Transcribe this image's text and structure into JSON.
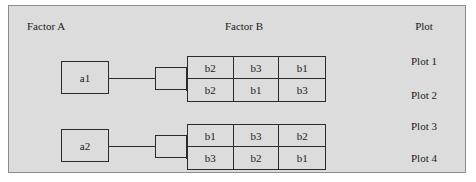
{
  "figure": {
    "headers": {
      "factor_a": "Factor A",
      "factor_b": "Factor B",
      "plot": "Plot"
    },
    "whole_plots": [
      {
        "label": "a1"
      },
      {
        "label": "a2"
      }
    ],
    "sub_plot_grids": [
      {
        "rows": [
          {
            "cells": [
              "b2",
              "b3",
              "b1"
            ]
          },
          {
            "cells": [
              "b2",
              "b1",
              "b3"
            ]
          }
        ]
      },
      {
        "rows": [
          {
            "cells": [
              "b1",
              "b3",
              "b2"
            ]
          },
          {
            "cells": [
              "b3",
              "b2",
              "b1"
            ]
          }
        ]
      }
    ],
    "plot_labels": [
      "Plot 1",
      "Plot 2",
      "Plot 3",
      "Plot 4"
    ],
    "colors": {
      "background": "#dcdcdc",
      "line": "#2b2b2b",
      "border": "#8d8d8d",
      "text": "#1a1a1a"
    }
  }
}
